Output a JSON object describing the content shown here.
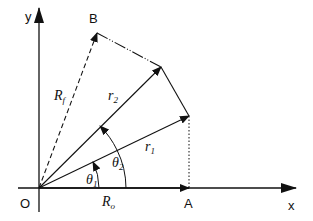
{
  "diagram": {
    "type": "vector-geometry",
    "colors": {
      "stroke": "#111111",
      "background": "#ffffff"
    },
    "axes": {
      "x_label": "x",
      "y_label": "y",
      "origin_label": "O"
    },
    "points": {
      "A": {
        "label": "A"
      },
      "B": {
        "label": "B"
      }
    },
    "vectors": {
      "r1": {
        "base": "r",
        "sub": "1"
      },
      "r2": {
        "base": "r",
        "sub": "2"
      },
      "Rf": {
        "base": "R",
        "sub": "f",
        "style": "dashed"
      },
      "Ro": {
        "base": "R",
        "sub": "o"
      }
    },
    "angles": {
      "theta1": {
        "base": "θ",
        "sub": "1"
      },
      "theta2": {
        "base": "θ",
        "sub": "2"
      }
    }
  }
}
